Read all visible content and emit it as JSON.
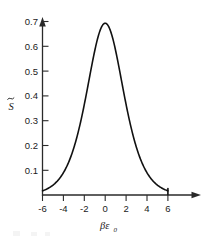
{
  "chart_data": {
    "type": "line",
    "title": "",
    "xlabel": "βε₀",
    "xlabel_main": "βε",
    "xlabel_subscript": "0",
    "ylabel": "S̃",
    "ylabel_main": "S",
    "ylabel_accent": "tilde",
    "xlim": [
      -6,
      6.8
    ],
    "ylim": [
      0,
      0.72
    ],
    "grid": false,
    "legend": null,
    "line_color": "#111111",
    "axis_color": "#2a2a2a",
    "background_color": "#ffffff",
    "xticks": [
      -6,
      -4,
      -2,
      0,
      2,
      4,
      6
    ],
    "xtick_labels": [
      "-6",
      "-4",
      "-2",
      "0",
      "2",
      "4",
      "6"
    ],
    "yticks": [
      0.1,
      0.2,
      0.3,
      0.4,
      0.5,
      0.6,
      0.7
    ],
    "ytick_labels": [
      "0.1",
      "0.2",
      "0.3",
      "0.4",
      "0.5",
      "0.6",
      "0.7"
    ],
    "peak_x": 0,
    "peak_y": 0.693,
    "x": [
      -6.0,
      -5.6,
      -5.2,
      -4.8,
      -4.4,
      -4.0,
      -3.6,
      -3.2,
      -2.8,
      -2.4,
      -2.0,
      -1.8,
      -1.6,
      -1.4,
      -1.2,
      -1.0,
      -0.8,
      -0.6,
      -0.4,
      -0.2,
      0.0,
      0.2,
      0.4,
      0.6,
      0.8,
      1.0,
      1.2,
      1.4,
      1.6,
      1.8,
      2.0,
      2.4,
      2.8,
      3.2,
      3.6,
      4.0,
      4.4,
      4.8,
      5.2,
      5.6,
      6.0
    ],
    "y": [
      0.0174,
      0.0241,
      0.0331,
      0.045,
      0.0607,
      0.0812,
      0.1076,
      0.141,
      0.1821,
      0.2311,
      0.2869,
      0.3164,
      0.3466,
      0.3765,
      0.4053,
      0.4323,
      0.4567,
      0.4781,
      0.496,
      0.51,
      0.5199,
      0.51,
      0.496,
      0.4781,
      0.4567,
      0.4323,
      0.4053,
      0.3765,
      0.3466,
      0.3164,
      0.2869,
      0.2311,
      0.1821,
      0.141,
      0.1076,
      0.0812,
      0.0607,
      0.045,
      0.0331,
      0.0241,
      0.0174
    ],
    "curve_points_px": "42,193.5 45,191.5 48,189 51,186.2 54,183 57,179.3 60,175 63,170.2 66,164.7 69,158.5 72,151.6 75,144 78,135.7 81,126.9 84,117.6 87,108.1 90,98.5 93,89.1 96,79.9 99,71.5 102,64 104,58.2 105.5,55.3 107,52.2 108.5,49.2 110,46.6 112,43.5 114,41 116,39 118,37 120,35.3 122,33.5 124,31.2 126,29 128,27.2 130,25.5 132.5,24.2 135,23.4 137.5,23.1 140,23.4 142.5,24.3 145,25.7 147.5,27.6 150,30 152.5,32.8 155,36 157.5,39.6 160,43.6 162.5,48 165,52.7 167.5,57.8 170,63.2 173,70 176,77.3 179,85 182,93 185,101.3 188,109.6 191,117.9 194,126 197,133.8 200,141.2 203,148.2 206,154.7 209,160.7 212,166.2 215,171.3 218,175.9 221,180.1 224,183.8 227,187.1 230,190 233,192.5"
  },
  "axes": {
    "x_axis_name": "horizontal-axis",
    "y_axis_name": "vertical-axis",
    "x_arrow": true,
    "y_arrow": true
  }
}
